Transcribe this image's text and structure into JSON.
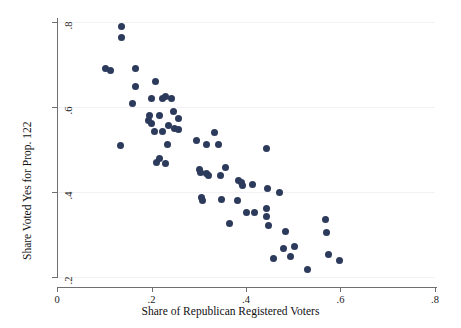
{
  "chart_data": {
    "type": "scatter",
    "title": "",
    "xlabel": "Share of Republican Registered Voters",
    "ylabel": "Share Voted Yes for Prop. 122",
    "xlim": [
      0,
      0.8
    ],
    "ylim": [
      0.2,
      0.8
    ],
    "xticks": [
      0,
      0.2,
      0.4,
      0.6,
      0.8
    ],
    "xtick_labels": [
      "0",
      ".2",
      ".4",
      ".6",
      ".8"
    ],
    "yticks": [
      0.2,
      0.4,
      0.6,
      0.8
    ],
    "ytick_labels": [
      ".2",
      ".4",
      ".6",
      ".8"
    ],
    "grid": true,
    "grid_axis": "y",
    "legend": null,
    "marker_color": "#2c3a5c",
    "marker_size": 7,
    "points": [
      [
        0.137,
        0.789
      ],
      [
        0.137,
        0.763
      ],
      [
        0.102,
        0.69
      ],
      [
        0.114,
        0.685
      ],
      [
        0.167,
        0.69
      ],
      [
        0.166,
        0.648
      ],
      [
        0.209,
        0.659
      ],
      [
        0.159,
        0.608
      ],
      [
        0.2,
        0.62
      ],
      [
        0.224,
        0.621
      ],
      [
        0.229,
        0.624
      ],
      [
        0.243,
        0.62
      ],
      [
        0.195,
        0.579
      ],
      [
        0.216,
        0.58
      ],
      [
        0.193,
        0.569
      ],
      [
        0.199,
        0.562
      ],
      [
        0.246,
        0.59
      ],
      [
        0.257,
        0.572
      ],
      [
        0.236,
        0.556
      ],
      [
        0.249,
        0.549
      ],
      [
        0.258,
        0.547
      ],
      [
        0.206,
        0.543
      ],
      [
        0.224,
        0.543
      ],
      [
        0.135,
        0.51
      ],
      [
        0.233,
        0.511
      ],
      [
        0.296,
        0.522
      ],
      [
        0.316,
        0.512
      ],
      [
        0.334,
        0.54
      ],
      [
        0.342,
        0.512
      ],
      [
        0.444,
        0.503
      ],
      [
        0.21,
        0.47
      ],
      [
        0.216,
        0.478
      ],
      [
        0.229,
        0.467
      ],
      [
        0.302,
        0.452
      ],
      [
        0.304,
        0.445
      ],
      [
        0.316,
        0.443
      ],
      [
        0.32,
        0.439
      ],
      [
        0.357,
        0.457
      ],
      [
        0.345,
        0.439
      ],
      [
        0.384,
        0.427
      ],
      [
        0.391,
        0.422
      ],
      [
        0.392,
        0.416
      ],
      [
        0.413,
        0.418
      ],
      [
        0.446,
        0.408
      ],
      [
        0.47,
        0.4
      ],
      [
        0.306,
        0.386
      ],
      [
        0.307,
        0.381
      ],
      [
        0.348,
        0.383
      ],
      [
        0.381,
        0.381
      ],
      [
        0.4,
        0.352
      ],
      [
        0.419,
        0.351
      ],
      [
        0.444,
        0.361
      ],
      [
        0.444,
        0.342
      ],
      [
        0.365,
        0.327
      ],
      [
        0.447,
        0.321
      ],
      [
        0.484,
        0.306
      ],
      [
        0.48,
        0.266
      ],
      [
        0.502,
        0.272
      ],
      [
        0.494,
        0.248
      ],
      [
        0.459,
        0.243
      ],
      [
        0.53,
        0.218
      ],
      [
        0.568,
        0.335
      ],
      [
        0.57,
        0.305
      ],
      [
        0.575,
        0.254
      ],
      [
        0.598,
        0.24
      ]
    ]
  },
  "axes": {
    "x_title": "Share of Republican Registered Voters",
    "y_title": "Share Voted Yes for Prop. 122"
  }
}
